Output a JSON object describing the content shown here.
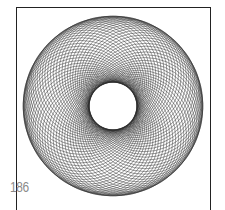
{
  "figure": {
    "type": "spirograph-torus",
    "center": [
      113,
      106
    ],
    "outer_radius": 90,
    "inner_radius": 24,
    "circle_count": 72,
    "stroke_color": "#2a2a2a",
    "background_color": "#ffffff"
  },
  "frame": {
    "border_color": "#222222"
  },
  "page": {
    "number": "186"
  }
}
